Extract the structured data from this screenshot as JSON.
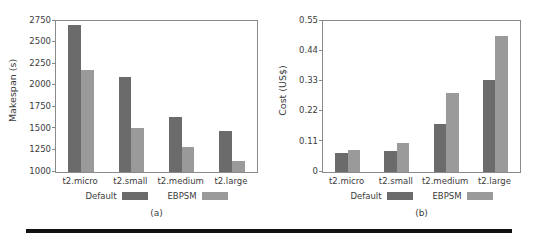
{
  "figure": {
    "panels": [
      {
        "id": "a",
        "caption": "(a)",
        "ylabel": "Makespan (s)"
      },
      {
        "id": "b",
        "caption": "(b)",
        "ylabel": "Cost (US$)"
      }
    ],
    "legend": {
      "default_label": "Default",
      "ebpsm_label": "EBPSM"
    },
    "colors": {
      "default_bar": "#6b6b6b",
      "ebpsm_bar": "#9a9a9a",
      "axis": "#8a8a8a",
      "text": "#3b3b3b",
      "rule": "#111111",
      "background": "#ffffff"
    }
  },
  "chart_data": [
    {
      "type": "bar",
      "title": "(a)",
      "xlabel": "",
      "ylabel": "Makespan (s)",
      "categories": [
        "t2.micro",
        "t2.small",
        "t2.medium",
        "t2.large"
      ],
      "series": [
        {
          "name": "Default",
          "values": [
            2700,
            2097,
            1637,
            1470
          ],
          "color": "#6b6b6b"
        },
        {
          "name": "EBPSM",
          "values": [
            2185,
            1515,
            1295,
            1125
          ],
          "color": "#9a9a9a"
        }
      ],
      "ylim": [
        1000,
        2750
      ],
      "yticks": [
        1000,
        1250,
        1500,
        1750,
        2000,
        2250,
        2500,
        2750
      ],
      "ytick_labels": [
        "1000",
        "1250",
        "1500",
        "1750",
        "2000",
        "2250",
        "2500",
        "2750"
      ],
      "grid": false,
      "legend_position": "below-axis"
    },
    {
      "type": "bar",
      "title": "(b)",
      "xlabel": "",
      "ylabel": "Cost (US$)",
      "categories": [
        "t2.micro",
        "t2.small",
        "t2.medium",
        "t2.large"
      ],
      "series": [
        {
          "name": "Default",
          "values": [
            0.07,
            0.078,
            0.175,
            0.335
          ],
          "color": "#6b6b6b"
        },
        {
          "name": "EBPSM",
          "values": [
            0.081,
            0.106,
            0.288,
            0.495
          ],
          "color": "#9a9a9a"
        }
      ],
      "ylim": [
        0,
        0.55
      ],
      "yticks": [
        0,
        0.11,
        0.22,
        0.33,
        0.44,
        0.55
      ],
      "ytick_labels": [
        "0",
        "0.11",
        "0.22",
        "0.33",
        "0.44",
        "0.55"
      ],
      "grid": false,
      "legend_position": "below-axis"
    }
  ]
}
